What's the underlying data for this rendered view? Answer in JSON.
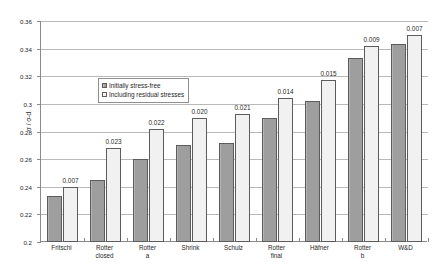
{
  "chart_data": {
    "type": "bar",
    "title": "",
    "xlabel": "",
    "ylabel": "σ / σ-d",
    "ylim": [
      0.2,
      0.36
    ],
    "ytick_step": 0.02,
    "yticks": [
      "0.36",
      "0.34",
      "0.32",
      "0.3",
      "0.28",
      "0.26",
      "0.24",
      "0.22",
      "0.2"
    ],
    "grid": true,
    "legend_position": "upper-left-inside",
    "categories": [
      "Fritschi",
      "Rotter\nclosed",
      "Rotter\na",
      "Shrink",
      "Schulz",
      "Rotter\nfinal",
      "Häfner",
      "Rotter\nb",
      "W&D"
    ],
    "series": [
      {
        "name": "Initially stress-free",
        "values": [
          0.233,
          0.245,
          0.26,
          0.27,
          0.272,
          0.29,
          0.302,
          0.333,
          0.343
        ]
      },
      {
        "name": "Including residual stresses",
        "values": [
          0.24,
          0.268,
          0.282,
          0.29,
          0.293,
          0.304,
          0.317,
          0.342,
          0.35
        ]
      }
    ],
    "annotations": [
      "0.007",
      "0.023",
      "0.022",
      "0.020",
      "0.021",
      "0.014",
      "0.015",
      "0.009",
      "0.007"
    ]
  },
  "legend": {
    "items": [
      {
        "label": "Initially stress-free",
        "color": "#9e9e9e"
      },
      {
        "label": "Including residual stresses",
        "color": "#f1f1f1"
      }
    ]
  },
  "colors": {
    "series_dark": "#9e9e9e",
    "series_light": "#f1f1f1",
    "bar_border": "#5c5c5c",
    "axis": "#8a8a8a",
    "gridline": "#b9b9b9",
    "text": "#1f1f1f"
  },
  "caption": {
    "text": ""
  }
}
